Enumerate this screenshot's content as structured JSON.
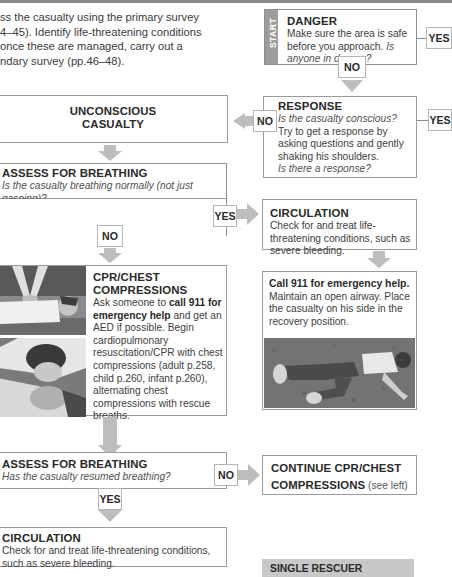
{
  "intro": {
    "text": "ss the casualty using the primary survey 4–45). Identify life-threatening conditions once these are managed, carry out a ndary survey (pp.46–48).",
    "lines": [
      "ss the casualty using the primary survey",
      "4–45). Identify life-threatening conditions",
      "once these are managed, carry out a",
      "ndary survey (pp.46–48)."
    ]
  },
  "danger": {
    "start_label": "START",
    "title": "DANGER",
    "body": "Make sure the area is safe before you approach.",
    "question": "Is anyone in danger?",
    "yes": "YES",
    "no": "NO"
  },
  "response": {
    "title": "RESPONSE",
    "question1": "Is the casualty conscious?",
    "body": "Try to get a response by asking questions and gently shaking his shoulders.",
    "question2": "Is there a response?",
    "no": "NO",
    "yes": "YES"
  },
  "unconscious": {
    "line1": "UNCONSCIOUS",
    "line2": "CASUALTY"
  },
  "assess1": {
    "title": "ASSESS FOR BREATHING",
    "question": "Is the casualty breathing normally (not just gasping)?",
    "yes": "YES",
    "no": "NO"
  },
  "circulation_right": {
    "title": "CIRCULATION",
    "body": "Check for and treat life-threatening conditions, such as severe bleeding."
  },
  "recovery": {
    "bold": "Call 911 for emergency help.",
    "body": "Maintain an open airway. Place the casualty on his side in the recovery position.",
    "image_alt": "Casualty lying in recovery position on grass"
  },
  "cpr": {
    "title_line1": "CPR/CHEST",
    "title_line2": "COMPRESSIONS",
    "pre": "Ask someone to ",
    "bold": "call 911 for emergency help",
    "post": " and get an AED if possible. Begin cardiopulmonary resuscitation/CPR with chest compressions (adult p.258, child p.260, infant p.260), alternating chest compressions with rescue breaths.",
    "image1_alt": "Chest compressions being performed",
    "image2_alt": "Rescue breaths being given"
  },
  "assess2": {
    "title": "ASSESS FOR BREATHING",
    "question": "Has the casualty resumed breathing?",
    "no": "NO",
    "yes": "YES"
  },
  "continue_cpr": {
    "title_line1": "CONTINUE CPR/CHEST",
    "title_line2": "COMPRESSIONS",
    "note": " (see left)"
  },
  "circulation_bottom": {
    "title": "CIRCULATION",
    "body": "Check for and treat life-threatening conditions, such as severe bleeding."
  },
  "single_rescuer": {
    "label": "SINGLE RESCUER"
  },
  "colors": {
    "arrow": "#bdbdbd",
    "border": "#9a9a9a",
    "start_bar": "#9d9d9d",
    "top_bar": "#8a8a8a",
    "single_rescuer_bg": "#c8c8c8"
  }
}
